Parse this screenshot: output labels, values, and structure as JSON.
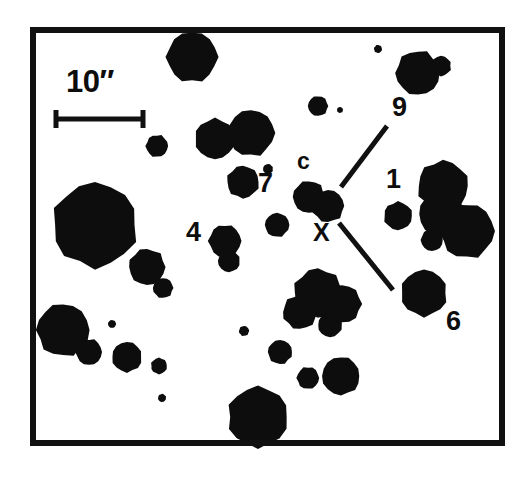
{
  "figure": {
    "background_color": "#ffffff",
    "ink_color": "#0d0d0d",
    "frame": {
      "name": "plot-border",
      "x": 30,
      "y": 27,
      "width": 475,
      "height": 419,
      "stroke_width": 6
    }
  },
  "scalebar": {
    "label": "10″",
    "value": 10,
    "unit": "arcsec",
    "label_x": 66,
    "label_y": 66,
    "bar_y": 119,
    "bar_x1": 54,
    "bar_x2": 145,
    "cap_half_height": 9,
    "stroke_width": 5
  },
  "labels": [
    {
      "name": "label-9",
      "text": "9",
      "x": 392,
      "y": 94,
      "class": "label-num"
    },
    {
      "name": "label-c",
      "text": "c",
      "x": 297,
      "y": 150,
      "class": "label-c"
    },
    {
      "name": "label-7",
      "text": "7",
      "x": 258,
      "y": 170,
      "class": "label-num"
    },
    {
      "name": "label-1",
      "text": "1",
      "x": 386,
      "y": 166,
      "class": "label-num"
    },
    {
      "name": "label-4",
      "text": "4",
      "x": 186,
      "y": 219,
      "class": "label-num"
    },
    {
      "name": "label-X",
      "text": "X",
      "x": 313,
      "y": 220,
      "class": "label-x"
    },
    {
      "name": "label-6",
      "text": "6",
      "x": 446,
      "y": 308,
      "class": "label-num"
    }
  ],
  "pointer_lines": [
    {
      "name": "pointer-line-upper",
      "x1": 341,
      "y1": 187,
      "x2": 387,
      "y2": 126,
      "stroke_width": 5
    },
    {
      "name": "pointer-line-lower",
      "x1": 339,
      "y1": 223,
      "x2": 393,
      "y2": 290,
      "stroke_width": 5
    }
  ],
  "chart_data": {
    "type": "scatter",
    "xlabel": "",
    "ylabel": "",
    "xlim": [
      30,
      505
    ],
    "ylim": [
      27,
      446
    ],
    "grid": false,
    "legend": "none",
    "annotations": [
      "10″",
      "9",
      "c",
      "7",
      "1",
      "4",
      "X",
      "6"
    ],
    "marker_units": "pixels (cx, cy, radius)",
    "points": [
      {
        "cx": 192,
        "cy": 57,
        "r": 25
      },
      {
        "cx": 418,
        "cy": 73,
        "r": 22
      },
      {
        "cx": 441,
        "cy": 66,
        "r": 10
      },
      {
        "cx": 378,
        "cy": 49,
        "r": 4
      },
      {
        "cx": 318,
        "cy": 106,
        "r": 10
      },
      {
        "cx": 340,
        "cy": 110,
        "r": 3
      },
      {
        "cx": 215,
        "cy": 139,
        "r": 20
      },
      {
        "cx": 251,
        "cy": 133,
        "r": 23
      },
      {
        "cx": 157,
        "cy": 146,
        "r": 11
      },
      {
        "cx": 268,
        "cy": 169,
        "r": 5
      },
      {
        "cx": 243,
        "cy": 182,
        "r": 16
      },
      {
        "cx": 309,
        "cy": 197,
        "r": 16
      },
      {
        "cx": 328,
        "cy": 206,
        "r": 16
      },
      {
        "cx": 398,
        "cy": 216,
        "r": 14
      },
      {
        "cx": 277,
        "cy": 225,
        "r": 12
      },
      {
        "cx": 225,
        "cy": 241,
        "r": 16
      },
      {
        "cx": 229,
        "cy": 261,
        "r": 11
      },
      {
        "cx": 95,
        "cy": 225,
        "r": 42
      },
      {
        "cx": 147,
        "cy": 267,
        "r": 18
      },
      {
        "cx": 163,
        "cy": 288,
        "r": 10
      },
      {
        "cx": 443,
        "cy": 186,
        "r": 25
      },
      {
        "cx": 441,
        "cy": 214,
        "r": 22
      },
      {
        "cx": 467,
        "cy": 231,
        "r": 27
      },
      {
        "cx": 432,
        "cy": 240,
        "r": 11
      },
      {
        "cx": 424,
        "cy": 293,
        "r": 23
      },
      {
        "cx": 318,
        "cy": 293,
        "r": 24
      },
      {
        "cx": 342,
        "cy": 304,
        "r": 19
      },
      {
        "cx": 300,
        "cy": 312,
        "r": 17
      },
      {
        "cx": 330,
        "cy": 325,
        "r": 12
      },
      {
        "cx": 63,
        "cy": 330,
        "r": 26
      },
      {
        "cx": 89,
        "cy": 352,
        "r": 13
      },
      {
        "cx": 127,
        "cy": 357,
        "r": 15
      },
      {
        "cx": 159,
        "cy": 366,
        "r": 8
      },
      {
        "cx": 112,
        "cy": 324,
        "r": 4
      },
      {
        "cx": 244,
        "cy": 331,
        "r": 5
      },
      {
        "cx": 162,
        "cy": 398,
        "r": 4
      },
      {
        "cx": 280,
        "cy": 352,
        "r": 12
      },
      {
        "cx": 308,
        "cy": 378,
        "r": 11
      },
      {
        "cx": 341,
        "cy": 376,
        "r": 19
      },
      {
        "cx": 258,
        "cy": 417,
        "r": 30
      }
    ]
  }
}
